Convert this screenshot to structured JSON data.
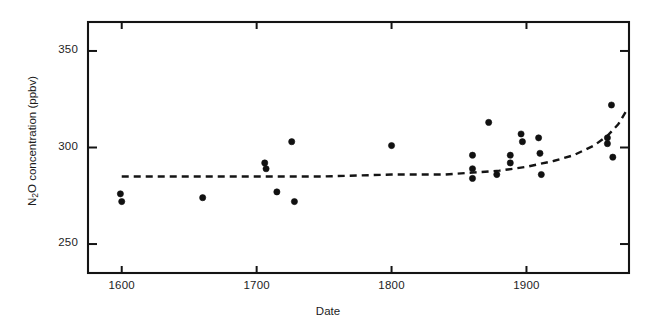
{
  "chart_data": {
    "type": "scatter",
    "title": "",
    "xlabel": "Date",
    "ylabel": "N2O concentration (ppbv)",
    "ylabel_parts": {
      "pre": "N",
      "sub": "2",
      "post": "O concentration (ppbv)"
    },
    "xlim": [
      1575,
      1976
    ],
    "ylim": [
      235,
      365
    ],
    "xticks": [
      1600,
      1700,
      1800,
      1900
    ],
    "yticks": [
      250,
      300,
      350
    ],
    "xtick_labels": [
      "1600",
      "1700",
      "1800",
      "1900"
    ],
    "ytick_labels": [
      "250",
      "300",
      "350"
    ],
    "grid": false,
    "legend": null,
    "frame": "box",
    "marker": {
      "shape": "circle",
      "color": "#111111",
      "size_px": 5
    },
    "series": [
      {
        "name": "ice-core N2O measurements",
        "type": "scatter",
        "points": [
          {
            "x": 1599,
            "y": 276
          },
          {
            "x": 1600,
            "y": 272
          },
          {
            "x": 1660,
            "y": 274
          },
          {
            "x": 1706,
            "y": 292
          },
          {
            "x": 1707,
            "y": 289
          },
          {
            "x": 1715,
            "y": 277
          },
          {
            "x": 1726,
            "y": 303
          },
          {
            "x": 1728,
            "y": 272
          },
          {
            "x": 1800,
            "y": 301
          },
          {
            "x": 1860,
            "y": 296
          },
          {
            "x": 1860,
            "y": 289
          },
          {
            "x": 1860,
            "y": 284
          },
          {
            "x": 1872,
            "y": 313
          },
          {
            "x": 1878,
            "y": 286
          },
          {
            "x": 1888,
            "y": 296
          },
          {
            "x": 1888,
            "y": 292
          },
          {
            "x": 1896,
            "y": 307
          },
          {
            "x": 1897,
            "y": 303
          },
          {
            "x": 1909,
            "y": 305
          },
          {
            "x": 1910,
            "y": 297
          },
          {
            "x": 1911,
            "y": 286
          },
          {
            "x": 1963,
            "y": 322
          },
          {
            "x": 1960,
            "y": 305
          },
          {
            "x": 1960,
            "y": 302
          },
          {
            "x": 1964,
            "y": 295
          }
        ]
      },
      {
        "name": "fitted trend",
        "type": "line",
        "style": "dashed",
        "points": [
          {
            "x": 1600,
            "y": 285
          },
          {
            "x": 1650,
            "y": 285
          },
          {
            "x": 1700,
            "y": 285
          },
          {
            "x": 1750,
            "y": 285
          },
          {
            "x": 1800,
            "y": 286
          },
          {
            "x": 1840,
            "y": 286
          },
          {
            "x": 1860,
            "y": 287
          },
          {
            "x": 1880,
            "y": 288
          },
          {
            "x": 1900,
            "y": 290
          },
          {
            "x": 1920,
            "y": 293
          },
          {
            "x": 1935,
            "y": 296
          },
          {
            "x": 1950,
            "y": 301
          },
          {
            "x": 1960,
            "y": 306
          },
          {
            "x": 1968,
            "y": 312
          },
          {
            "x": 1974,
            "y": 319
          }
        ]
      }
    ]
  },
  "axes": {
    "x_axis_label": "Date",
    "y_axis_label": "N2O concentration (ppbv)"
  }
}
